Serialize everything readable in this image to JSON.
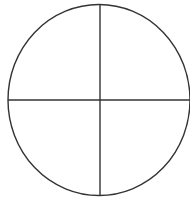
{
  "diagram": {
    "type": "circle-divided-into-quadrants",
    "shape": "ellipse",
    "quadrants": 4,
    "stroke_color": "#333333",
    "background_color": "#ffffff",
    "labels": []
  }
}
